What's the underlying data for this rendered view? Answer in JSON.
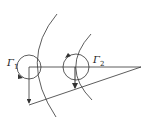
{
  "diagram": {
    "type": "vortex-geometry",
    "labels": {
      "gamma1": {
        "symbol": "Γ",
        "sub": "1"
      },
      "gamma2": {
        "symbol": "Γ",
        "sub": "2"
      }
    },
    "colors": {
      "stroke": "#333333",
      "background": "#ffffff"
    }
  }
}
